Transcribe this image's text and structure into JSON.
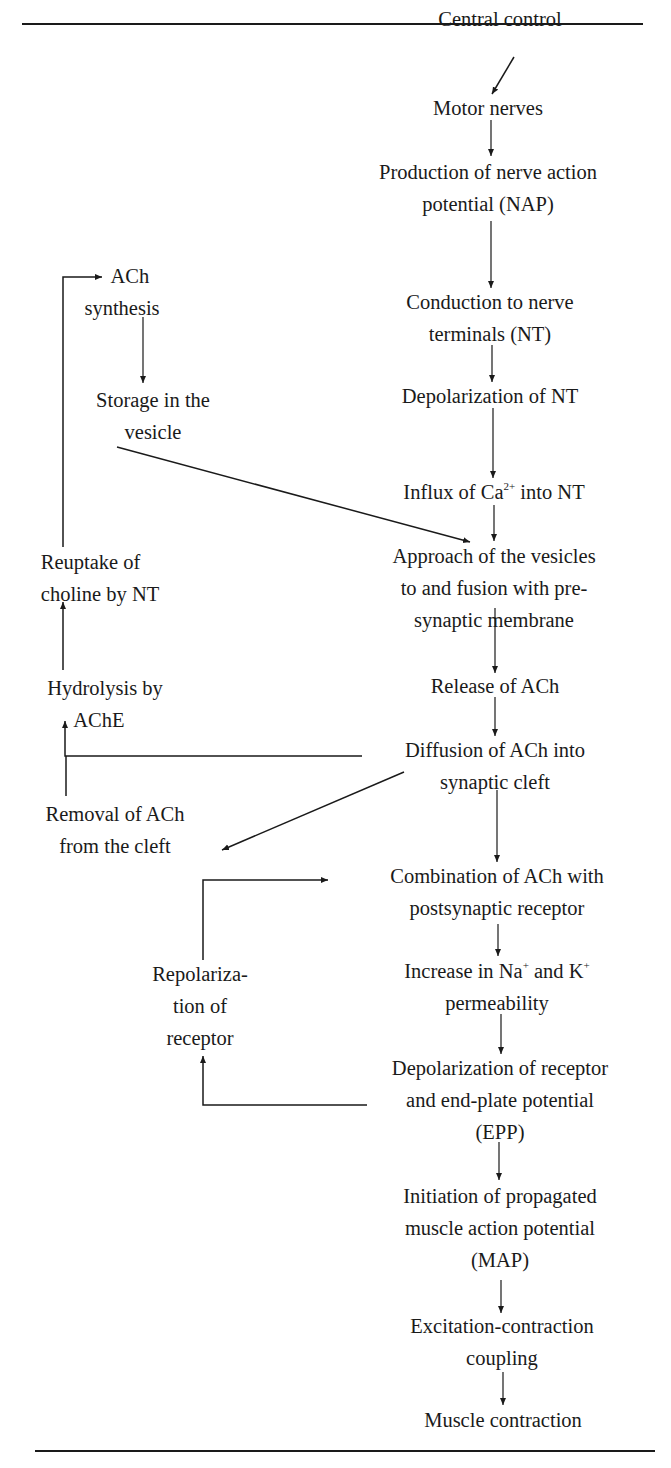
{
  "diagram": {
    "main_chain": [
      {
        "id": "central_control",
        "lines": [
          "Central control"
        ]
      },
      {
        "id": "motor_nerves",
        "lines": [
          "Motor nerves"
        ]
      },
      {
        "id": "nap",
        "lines": [
          "Production of nerve action",
          "potential (NAP)"
        ]
      },
      {
        "id": "conduction",
        "lines": [
          "Conduction to nerve",
          "terminals (NT)"
        ]
      },
      {
        "id": "depol_nt",
        "lines": [
          "Depolarization of NT"
        ]
      },
      {
        "id": "ca_influx",
        "lines": [
          "Influx of Ca",
          "2+",
          " into NT"
        ]
      },
      {
        "id": "approach",
        "lines": [
          "Approach of the vesicles",
          "to and fusion with pre-",
          "synaptic membrane"
        ]
      },
      {
        "id": "release",
        "lines": [
          "Release of ACh"
        ]
      },
      {
        "id": "diffusion",
        "lines": [
          "Diffusion of ACh into",
          "synaptic cleft"
        ]
      },
      {
        "id": "combination",
        "lines": [
          "Combination of ACh with",
          "postsynaptic receptor"
        ]
      },
      {
        "id": "permeability",
        "lines": [
          "Increase in Na",
          "+",
          " and K",
          "+",
          "permeability"
        ]
      },
      {
        "id": "epp",
        "lines": [
          "Depolarization of receptor",
          "and end-plate potential",
          "(EPP)"
        ]
      },
      {
        "id": "map",
        "lines": [
          "Initiation of propagated",
          "muscle action potential",
          "(MAP)"
        ]
      },
      {
        "id": "ec_coupling",
        "lines": [
          "Excitation-contraction",
          "coupling"
        ]
      },
      {
        "id": "contraction",
        "lines": [
          "Muscle contraction"
        ]
      }
    ],
    "side_nodes": [
      {
        "id": "ach_synthesis",
        "lines": [
          "ACh",
          "synthesis"
        ]
      },
      {
        "id": "storage",
        "lines": [
          "Storage in the",
          "vesicle"
        ]
      },
      {
        "id": "reuptake",
        "lines": [
          "Reuptake of",
          "choline by NT"
        ]
      },
      {
        "id": "hydrolysis",
        "lines": [
          "Hydrolysis by",
          "AChE"
        ]
      },
      {
        "id": "removal",
        "lines": [
          "Removal of ACh",
          "from the cleft"
        ]
      },
      {
        "id": "repolarization",
        "lines": [
          "Repolariza-",
          "tion of",
          "receptor"
        ]
      }
    ],
    "edges": [
      [
        "central_control",
        "motor_nerves"
      ],
      [
        "motor_nerves",
        "nap"
      ],
      [
        "nap",
        "conduction"
      ],
      [
        "conduction",
        "depol_nt"
      ],
      [
        "depol_nt",
        "ca_influx"
      ],
      [
        "ca_influx",
        "approach"
      ],
      [
        "storage",
        "approach"
      ],
      [
        "approach",
        "release"
      ],
      [
        "release",
        "diffusion"
      ],
      [
        "diffusion",
        "hydrolysis"
      ],
      [
        "diffusion",
        "removal"
      ],
      [
        "diffusion",
        "combination"
      ],
      [
        "hydrolysis",
        "reuptake"
      ],
      [
        "reuptake",
        "ach_synthesis"
      ],
      [
        "ach_synthesis",
        "storage"
      ],
      [
        "combination",
        "permeability"
      ],
      [
        "permeability",
        "epp"
      ],
      [
        "epp",
        "repolarization"
      ],
      [
        "repolarization",
        "combination"
      ],
      [
        "epp",
        "map"
      ],
      [
        "map",
        "ec_coupling"
      ],
      [
        "ec_coupling",
        "contraction"
      ]
    ]
  }
}
